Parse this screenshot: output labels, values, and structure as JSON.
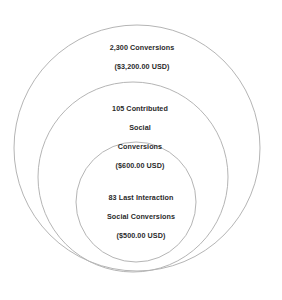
{
  "diagram": {
    "type": "nested-circles",
    "background_color": "#ffffff",
    "stroke_color": "#b5b5b5",
    "text_color": "#2a2a2a",
    "circles": [
      {
        "id": "outer",
        "name": "conversions",
        "cx": 137,
        "cy": 148,
        "r": 123
      },
      {
        "id": "middle",
        "name": "contributed-social-conversions",
        "cx": 133,
        "cy": 177,
        "r": 95
      },
      {
        "id": "inner",
        "name": "last-interaction-social-conversions",
        "cx": 136,
        "cy": 202,
        "r": 60
      }
    ]
  },
  "labels": {
    "outer": {
      "line1": "2,300 Conversions",
      "line2": "($3,200.00 USD)"
    },
    "middle": {
      "line1": "105 Contributed",
      "line2": "Social",
      "line3": "Conversions",
      "line4": "($600.00 USD)"
    },
    "inner": {
      "line1": "83 Last Interaction",
      "line2": "Social Conversions",
      "line3": "($500.00 USD)"
    }
  },
  "chart_data": {
    "type": "pie",
    "title": "",
    "xlabel": "",
    "ylabel": "",
    "categories": [
      "Conversions",
      "Contributed Social Conversions",
      "Last Interaction Social Conversions"
    ],
    "values": [
      2300,
      105,
      83
    ],
    "value_unit": "conversions",
    "monetary_values": [
      3200.0,
      600.0,
      500.0
    ],
    "currency": "USD",
    "monetary_labels": [
      "($3,200.00 USD)",
      "($600.00 USD)",
      "($500.00 USD)"
    ],
    "encoding": "nested circles (radius), not area-proportional",
    "radii_px": [
      123,
      95,
      60
    ],
    "legend": "none",
    "grid": false
  }
}
